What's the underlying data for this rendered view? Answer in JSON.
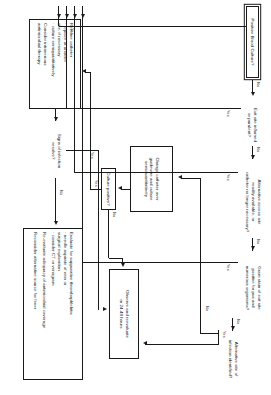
{
  "diagram": {
    "orientation": "rotated-90-clockwise",
    "edge_labels": {
      "yes": "Yes",
      "no": "No"
    },
    "nodes": {
      "start": {
        "name": "positive-blood-culture",
        "lines": [
          "Positive Blood Culture?"
        ]
      },
      "exit_site": {
        "name": "exit-site-inflamed",
        "lines": [
          "Exit site inflamed",
          "or purulent?"
        ]
      },
      "alt_access": {
        "name": "alternative-access-site",
        "lines": [
          "Alternative access site",
          "readily available, or",
          "catheter no longer necessary?"
        ]
      },
      "gram_stain": {
        "name": "gram-stain-exit-site",
        "lines": [
          "Gram stain of exit site",
          "positive for pus and",
          "numerous organisms?"
        ]
      },
      "alt_infection": {
        "name": "alternative-site-of-infection",
        "lines": [
          "Alternative site of",
          "infection identified?"
        ]
      },
      "observe": {
        "name": "observe-and-reevaluate",
        "lines": [
          "Observe and reevaluate",
          "in 24-48 hours"
        ]
      },
      "change_cath": {
        "name": "change-catheter-over-guidewire",
        "lines": [
          "Change catheter over",
          "guidewire and culture",
          "semiquantitatively"
        ]
      },
      "culture_pos": {
        "name": "culture-positive",
        "lines": [
          "Culture positive?"
        ]
      },
      "remove_cath": {
        "name": "remove-catheter",
        "lines": [
          "Remove catheter",
          "  · replace at another",
          "    site, if necessary",
          "  · culture semiquantitatively",
          "",
          "Consider intravenous",
          "antimicrobial therapy"
        ]
      },
      "signs_resolve": {
        "name": "signs-of-infection-resolve",
        "lines": [
          "Signs of infection",
          "resolve?"
        ]
      },
      "evaluate": {
        "name": "evaluate-suppurative-thrombophlebitis",
        "lines": [
          "Evaluate for suppurative thrombophlebitis",
          "  · needle aspirate of vein or",
          "    surgical exploration",
          "  · consider CT or venogram",
          "",
          "Re-evaluate adequacy of antimicrobial coverage",
          "",
          "Reconsider alternative source for fever"
        ]
      }
    },
    "edges": [
      {
        "from": "start",
        "to": "exit_site",
        "label": "No"
      },
      {
        "from": "start",
        "to": "remove_cath",
        "label": "Yes"
      },
      {
        "from": "exit_site",
        "to": "alt_access",
        "label": "No"
      },
      {
        "from": "exit_site",
        "to": "remove_cath",
        "label": "Yes"
      },
      {
        "from": "alt_access",
        "to": "gram_stain",
        "label": "No"
      },
      {
        "from": "alt_access",
        "to": "remove_cath",
        "label": "Yes"
      },
      {
        "from": "gram_stain",
        "to": "alt_infection",
        "label": "No"
      },
      {
        "from": "gram_stain",
        "to": "remove_cath",
        "label": "Yes"
      },
      {
        "from": "alt_infection",
        "to": "observe",
        "label": "Yes"
      },
      {
        "from": "alt_infection",
        "to": "change_cath",
        "label": "No"
      },
      {
        "from": "change_cath",
        "to": "culture_pos",
        "label": ""
      },
      {
        "from": "culture_pos",
        "to": "observe",
        "label": "No"
      },
      {
        "from": "culture_pos",
        "to": "remove_cath",
        "label": "Yes"
      },
      {
        "from": "remove_cath",
        "to": "signs_resolve",
        "label": ""
      },
      {
        "from": "signs_resolve",
        "to": "observe",
        "label": "Yes"
      },
      {
        "from": "signs_resolve",
        "to": "evaluate",
        "label": "No"
      }
    ]
  }
}
